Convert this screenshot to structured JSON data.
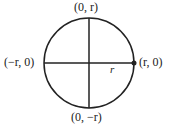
{
  "diagram": {
    "labels": {
      "top": "(0, r)",
      "bottom": "(0, −r)",
      "left": "(−r, 0)",
      "right": "(r, 0)",
      "radius": "r"
    },
    "colors": {
      "stroke": "#222222"
    }
  }
}
